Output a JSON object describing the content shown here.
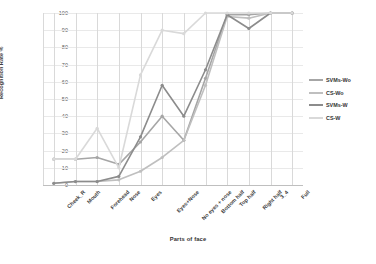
{
  "chart_data": {
    "type": "line",
    "title": "",
    "xlabel": "Parts of face",
    "ylabel": "Recognition Rate %",
    "ylim": [
      0,
      100
    ],
    "yticks": [
      0,
      10,
      20,
      30,
      40,
      50,
      60,
      70,
      80,
      90,
      100
    ],
    "grid": true,
    "legend_position": "right",
    "categories": [
      "Cheek_R",
      "Mouth",
      "Forehead",
      "Nose",
      "Eyes",
      "Eyes+Nose",
      "No eyes + nose",
      "Bottom half",
      "Top half",
      "Right half",
      "3_4",
      "Full"
    ],
    "series": [
      {
        "name": "SVMs-Wo",
        "color": "#a6a6a6",
        "values": [
          15,
          15,
          16,
          12,
          25,
          40,
          26,
          62,
          99,
          99,
          100,
          100
        ]
      },
      {
        "name": "CS-Wo",
        "color": "#bfbfbf",
        "values": [
          1,
          2,
          2,
          3,
          8,
          16,
          26,
          58,
          98,
          97,
          100,
          100
        ]
      },
      {
        "name": "SVMs-W",
        "color": "#8c8c8c",
        "values": [
          1,
          2,
          2,
          5,
          28,
          58,
          40,
          67,
          99,
          91,
          100,
          100
        ]
      },
      {
        "name": "CS-W",
        "color": "#d9d9d9",
        "values": [
          15,
          15,
          33,
          10,
          64,
          90,
          88,
          100,
          100,
          100,
          100,
          100
        ]
      }
    ]
  },
  "legend": {
    "items": [
      {
        "label": "SVMs-Wo"
      },
      {
        "label": "CS-Wo"
      },
      {
        "label": "SVMs-W"
      },
      {
        "label": "CS-W"
      }
    ]
  }
}
